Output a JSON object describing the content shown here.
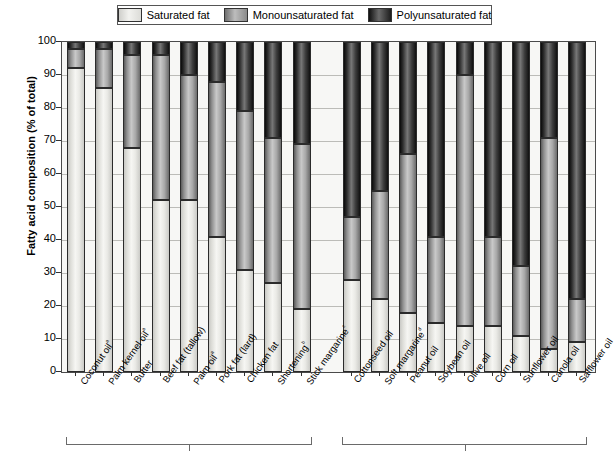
{
  "legend": {
    "items": [
      {
        "label": "Saturated fat",
        "icon": "swatch-saturated",
        "color": "#e8e8e4"
      },
      {
        "label": "Monounsaturated fat",
        "icon": "swatch-monounsaturated",
        "color": "#a0a0a0"
      },
      {
        "label": "Polyunsaturated fat",
        "icon": "swatch-polyunsaturated",
        "color": "#2a2a2a"
      }
    ]
  },
  "chart_data": {
    "type": "bar",
    "subtype": "stacked-percentage",
    "title": "",
    "xlabel": "",
    "ylabel": "Fatty acid composition (% of total)",
    "ylim": [
      0,
      100
    ],
    "yticks": [
      0,
      10,
      20,
      30,
      40,
      50,
      60,
      70,
      80,
      90,
      100
    ],
    "ytick_labels": [
      "0",
      "10",
      "20",
      "30",
      "40",
      "50",
      "60",
      "70",
      "80",
      "90",
      "100"
    ],
    "grid": true,
    "legend_position": "top",
    "categories": [
      "Coconut oilᵃ",
      "Palm kernel oilᵃ",
      "Butter",
      "Beef fat (tallow)",
      "Palm oilᵃ",
      "Pork fat (lard)",
      "Chicken fat",
      "Shorteningᵇ",
      "Stick margarineᶜ",
      "Cottonseed oil",
      "Soft margarineᵈ",
      "Peanut oil",
      "Soybean oil",
      "Olive oil",
      "Corn oil",
      "Sunflower oil",
      "Canola oil",
      "Safflower oil"
    ],
    "series": [
      {
        "name": "Saturated fat",
        "values": [
          92,
          86,
          68,
          52,
          52,
          41,
          31,
          27,
          19,
          28,
          22,
          18,
          15,
          14,
          14,
          11,
          7,
          9
        ]
      },
      {
        "name": "Monounsaturated fat",
        "values": [
          6,
          12,
          28,
          44,
          38,
          47,
          48,
          44,
          50,
          19,
          33,
          48,
          26,
          76,
          27,
          21,
          64,
          13
        ]
      },
      {
        "name": "Polyunsaturated fat",
        "values": [
          2,
          2,
          4,
          4,
          10,
          12,
          21,
          29,
          31,
          53,
          45,
          34,
          59,
          10,
          59,
          68,
          29,
          78
        ]
      }
    ],
    "groups": [
      {
        "label": "",
        "start_index": 0,
        "end_index": 8
      },
      {
        "label": "",
        "start_index": 9,
        "end_index": 17
      }
    ]
  }
}
